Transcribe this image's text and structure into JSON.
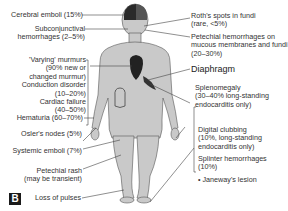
{
  "figure": {
    "panel_label": "B",
    "body_color": "#c8c8c8",
    "dark_color": "#2a2a2a",
    "line_color": "#444444"
  },
  "labels_left": [
    {
      "id": "cerebral",
      "lines": [
        "Cerebral emboli (15%)"
      ]
    },
    {
      "id": "subconj",
      "lines": [
        "Subconjunctival",
        "hemorrhages (2–5%)"
      ]
    },
    {
      "id": "murmurs",
      "lines": [
        "'Varying' murmurs",
        "(90% new or",
        "changed murmur)",
        "Conduction disorder",
        "(10–20%)",
        "Cardiac failure",
        "(40–50%)"
      ]
    },
    {
      "id": "hematuria",
      "lines": [
        "Hematuria (60–70%)"
      ]
    },
    {
      "id": "osler",
      "lines": [
        "Osler's nodes (5%)"
      ]
    },
    {
      "id": "systemic",
      "lines": [
        "Systemic emboli (7%)"
      ]
    },
    {
      "id": "petechial_rash",
      "lines": [
        "Petechial rash",
        "(may be transient)"
      ]
    },
    {
      "id": "pulses",
      "lines": [
        "Loss of pulses"
      ]
    }
  ],
  "labels_right": [
    {
      "id": "roth",
      "lines": [
        "Roth's spots in fundi",
        "(rare, <5%)"
      ]
    },
    {
      "id": "petechial_hem",
      "lines": [
        "Petechial hemorrhages on",
        "mucous membranes and fundi",
        "(20–30%)"
      ]
    },
    {
      "id": "diaphragm",
      "lines": [
        "Diaphragm"
      ]
    },
    {
      "id": "spleno",
      "lines": [
        "Splenomegaly",
        "(30–40% long-standing",
        "endocarditis only)"
      ]
    },
    {
      "id": "clubbing",
      "lines": [
        "Digital clubbing",
        "(10%, long-standing",
        "endocarditis only)"
      ]
    },
    {
      "id": "splinter",
      "lines": [
        "Splinter hemorrhages",
        "(10%)"
      ]
    },
    {
      "id": "janeway",
      "lines": [
        "• Janeway's lesion"
      ]
    }
  ]
}
